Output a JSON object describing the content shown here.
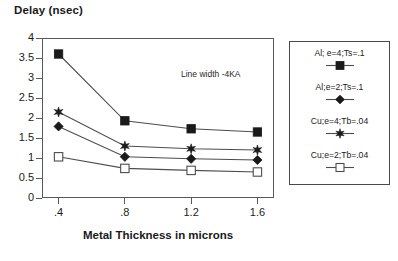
{
  "chart_data": {
    "type": "line",
    "title": "",
    "ylabel": "Delay (nsec)",
    "xlabel": "Metal Thickness in microns",
    "x": [
      0.4,
      0.8,
      1.2,
      1.6
    ],
    "xtick_labels": [
      ".4",
      ".8",
      "1.2",
      "1.6"
    ],
    "ytick_labels": [
      "0",
      "0.5",
      "1",
      "1.5",
      "2",
      "2.5",
      "3",
      "3.5",
      "4"
    ],
    "ytick_values": [
      0,
      0.5,
      1,
      1.5,
      2,
      2.5,
      3,
      3.5,
      4
    ],
    "xlim": [
      0.3,
      1.7
    ],
    "ylim": [
      0,
      4
    ],
    "grid": false,
    "legend_position": "right-outside",
    "annotations": [
      {
        "text": "Line width -4KA",
        "x": 1.12,
        "y": 3.22
      }
    ],
    "series": [
      {
        "name": "Al; e=4;Ts=.1",
        "marker": "filled-square",
        "values": [
          3.6,
          1.93,
          1.73,
          1.65
        ]
      },
      {
        "name": "Al;e=2;Ts=.1",
        "marker": "star",
        "values": [
          2.15,
          1.3,
          1.23,
          1.2
        ]
      },
      {
        "name": "Cu;e=4;Tb=.04",
        "marker": "filled-diamond",
        "values": [
          1.79,
          1.03,
          0.98,
          0.95
        ]
      },
      {
        "name": "Cu;e=2;Tb=.04",
        "marker": "open-square",
        "values": [
          1.03,
          0.74,
          0.69,
          0.65
        ]
      }
    ],
    "colors": {
      "line": "#4d4d4d",
      "marker_fill": "#1a1a1a",
      "axis": "#5a5a5a",
      "text": "#1a1a1a",
      "background": "#ffffff"
    }
  },
  "legend": {
    "entries": [
      {
        "label": "Al; e=4;Ts=.1",
        "marker": "filled-square"
      },
      {
        "label": "Al;e=2;Ts=.1",
        "marker": "filled-diamond"
      },
      {
        "label": "Cu;e=4;Tb=.04",
        "marker": "star"
      },
      {
        "label": "Cu;e=2;Tb=.04",
        "marker": "open-square"
      }
    ]
  }
}
